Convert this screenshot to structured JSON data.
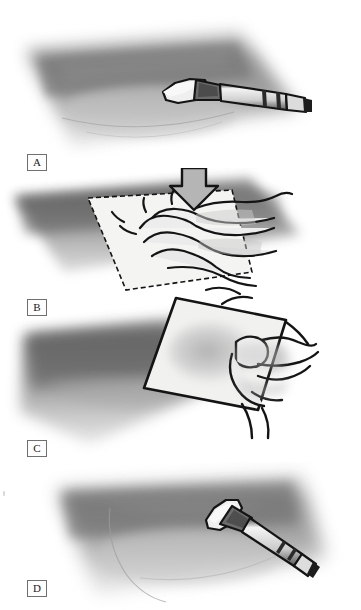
{
  "figure": {
    "background_color": "#ffffff",
    "ink_color": "#141414",
    "wash_dark": "#7d7d7d",
    "wash_mid": "#a9a9a9",
    "wash_light": "#d5d5d5",
    "paper_color": "#f2f2f0"
  },
  "panels": [
    {
      "id": "A",
      "label": "A",
      "caption": "Brush laying a graded wash on the paper",
      "objects": [
        "wash-patch",
        "paint-brush"
      ]
    },
    {
      "id": "B",
      "label": "B",
      "caption": "Hand pressing a tissue square down onto the wet wash",
      "objects": [
        "wash-patch",
        "tissue-square",
        "hand",
        "down-arrow"
      ]
    },
    {
      "id": "C",
      "label": "C",
      "caption": "Hand lifting the tissue square away, revealing the lightened area",
      "objects": [
        "wash-patch",
        "tissue-square",
        "hand"
      ]
    },
    {
      "id": "D",
      "label": "D",
      "caption": "Brush returning to the softened wash",
      "objects": [
        "wash-patch",
        "paint-brush"
      ]
    }
  ],
  "annotations": {
    "arrow_direction": "down",
    "arrow_label": "press down"
  }
}
